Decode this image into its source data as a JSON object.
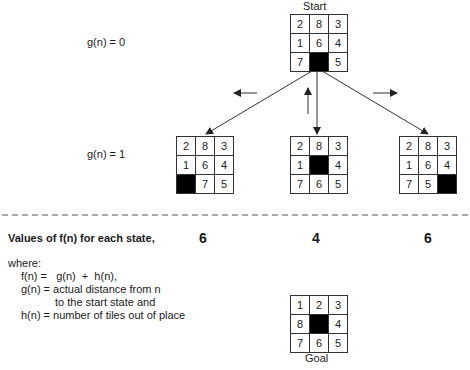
{
  "start": {
    "label": "Start",
    "tiles": [
      "2",
      "8",
      "3",
      "1",
      "6",
      "4",
      "7",
      "",
      "5"
    ]
  },
  "level_labels": {
    "g0": "g(n) = 0",
    "g1": "g(n) = 1"
  },
  "children": [
    {
      "name": "left",
      "tiles": [
        "2",
        "8",
        "3",
        "1",
        "6",
        "4",
        "",
        "7",
        "5"
      ],
      "f": "6"
    },
    {
      "name": "middle",
      "tiles": [
        "2",
        "8",
        "3",
        "1",
        "",
        "4",
        "7",
        "6",
        "5"
      ],
      "f": "4"
    },
    {
      "name": "right",
      "tiles": [
        "2",
        "8",
        "3",
        "1",
        "6",
        "4",
        "7",
        "5",
        ""
      ],
      "f": "6"
    }
  ],
  "values_heading": "Values of f(n) for each state,",
  "where": {
    "title": "where:",
    "line1": "f(n) =   g(n)  +  h(n),",
    "line2": "g(n) = actual distance from n",
    "line3": "to the start state and",
    "line4": "h(n) = number of tiles out of place"
  },
  "goal": {
    "label": "Goal",
    "tiles": [
      "1",
      "2",
      "3",
      "8",
      "",
      "4",
      "7",
      "6",
      "5"
    ]
  },
  "move_arrows": [
    "left",
    "up",
    "right"
  ]
}
